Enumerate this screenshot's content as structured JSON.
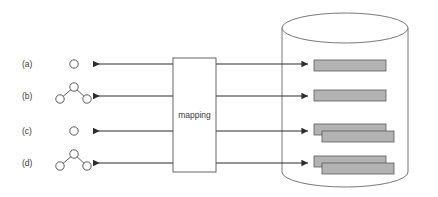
{
  "diagram": {
    "background_color": "#ffffff",
    "stroke_color": "#4a4a4a",
    "arrow_color": "#2d2d2d",
    "record_fill_color": "#b3b3b3",
    "record_stroke_color": "#5a5a5a",
    "mapping_box": {
      "label": "mapping",
      "x": 173,
      "y": 58,
      "width": 43,
      "height": 114
    },
    "rows": [
      {
        "label": "(a)",
        "label_x": 22,
        "label_y": 67,
        "arrow_y": 64,
        "graph_type": "single-node",
        "record_type": "single",
        "record_y": 61
      },
      {
        "label": "(b)",
        "label_x": 22,
        "label_y": 99,
        "arrow_y": 96,
        "graph_type": "three-node-tree",
        "record_type": "single",
        "record_y": 90
      },
      {
        "label": "(c)",
        "label_x": 22,
        "label_y": 134,
        "arrow_y": 131,
        "graph_type": "single-node",
        "record_type": "stacked-pair",
        "record_y": 124
      },
      {
        "label": "(d)",
        "label_x": 22,
        "label_y": 166,
        "arrow_y": 163,
        "graph_type": "three-node-tree",
        "record_type": "stacked-pair",
        "record_y": 156
      }
    ],
    "cylinder": {
      "center_x": 345,
      "left_x": 282,
      "right_x": 408,
      "top_y": 13,
      "bottom_y": 172,
      "ellipse_ry": 15,
      "name": "database-cylinder"
    },
    "left_arrows": {
      "from_x": 173,
      "to_x": 92,
      "direction": "left"
    },
    "right_arrows": {
      "from_x": 216,
      "to_x": 309,
      "direction": "right"
    },
    "record_bar": {
      "x": 314,
      "width": 72,
      "height": 11,
      "offset_x": 8,
      "offset_y": 7
    },
    "single_node": {
      "cx": 74,
      "cy": 64,
      "r": 4.2
    },
    "tree_nodes": {
      "top": {
        "dx": 0,
        "dy": -9,
        "r": 4.2
      },
      "left": {
        "dx": -14,
        "dy": 3,
        "r": 4.2
      },
      "right": {
        "dx": 13,
        "dy": 3,
        "r": 4.2
      },
      "center_x": 74
    }
  }
}
